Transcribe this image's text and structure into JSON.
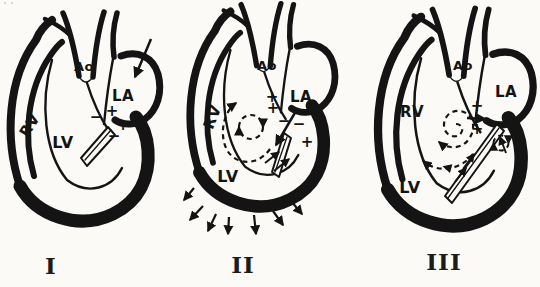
{
  "canvas": {
    "width": 540,
    "height": 287,
    "background": "#fbfaf7",
    "ink": "#141414"
  },
  "figure": {
    "panels": [
      {
        "numeral": "I",
        "labels": {
          "ao": "Ao",
          "la": "LA",
          "rv": "RV",
          "lv": "LV"
        },
        "signs": {
          "outflow_minus": "−",
          "valve_upper_plus": "+",
          "valve_lower_plus": "+",
          "valve_lower_minus": "−"
        }
      },
      {
        "numeral": "II",
        "labels": {
          "ao": "Ao",
          "la": "LA",
          "rv": "RV",
          "lv": "LV"
        },
        "signs": {
          "outflow_plus_1": "+",
          "outflow_plus_2": "+",
          "inflow_minus_1": "−",
          "inflow_minus_2": "−",
          "valve_plus": "+"
        }
      },
      {
        "numeral": "III",
        "labels": {
          "ao": "Ao",
          "la": "LA",
          "rv": "RV",
          "lv": "LV"
        },
        "signs": {
          "outflow_plus_upper": "+",
          "outflow_plus_lower": "+",
          "atrial_minus": "−",
          "atrial_plus": "+"
        }
      }
    ]
  }
}
